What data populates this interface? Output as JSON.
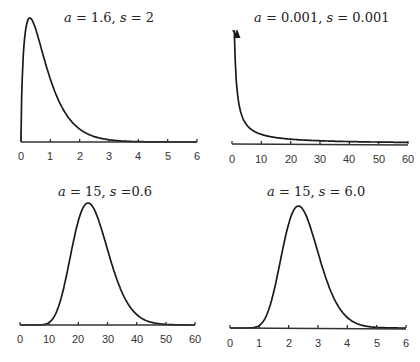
{
  "chart_data": [
    {
      "type": "line",
      "title": "a = 1.6, s = 2",
      "title_parts": {
        "a_label": "a",
        "a_value": "= 1.6,",
        "s_label": "s",
        "s_value": "= 2"
      },
      "distribution": "gamma",
      "params": {
        "a": 1.6,
        "s": 2
      },
      "xlabel": "",
      "ylabel": "",
      "xlim": [
        0,
        6
      ],
      "xticks": [
        "0",
        "1",
        "2",
        "3",
        "4",
        "5",
        "6"
      ],
      "grid": false,
      "legend": "none"
    },
    {
      "type": "line",
      "title": "a = 0.001, s = 0.001",
      "title_parts": {
        "a_label": "a",
        "a_value": "= 0.001,",
        "s_label": "s",
        "s_value": "= 0.001"
      },
      "distribution": "gamma",
      "params": {
        "a": 0.001,
        "s": 0.001
      },
      "xlabel": "",
      "ylabel": "",
      "xlim": [
        0,
        60
      ],
      "xticks": [
        "0",
        "10",
        "20",
        "30",
        "40",
        "50",
        "60"
      ],
      "annotation": "arrow at x=0 indicating density goes to infinity",
      "grid": false,
      "legend": "none"
    },
    {
      "type": "line",
      "title": "a = 15, s =0.6",
      "title_parts": {
        "a_label": "a",
        "a_value": "= 15,",
        "s_label": "s",
        "s_value": "=0.6"
      },
      "distribution": "gamma",
      "params": {
        "a": 15,
        "s": 0.6
      },
      "xlabel": "",
      "ylabel": "",
      "xlim": [
        0,
        60
      ],
      "xticks": [
        "0",
        "10",
        "20",
        "30",
        "40",
        "50",
        "60"
      ],
      "grid": false,
      "legend": "none"
    },
    {
      "type": "line",
      "title": "a = 15, s = 6.0",
      "title_parts": {
        "a_label": "a",
        "a_value": "= 15,",
        "s_label": "s",
        "s_value": "= 6.0"
      },
      "distribution": "gamma",
      "params": {
        "a": 15,
        "s": 6.0
      },
      "xlabel": "",
      "ylabel": "",
      "xlim": [
        0,
        6
      ],
      "xticks": [
        "0",
        "1",
        "2",
        "3",
        "4",
        "5",
        "6"
      ],
      "grid": false,
      "legend": "none"
    }
  ]
}
